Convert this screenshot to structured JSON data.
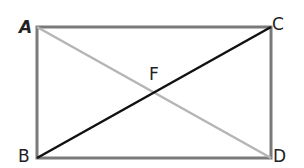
{
  "diagram": {
    "title": "",
    "points": {
      "A": {
        "label": "A",
        "x": 37,
        "y": 27
      },
      "C": {
        "label": "C",
        "x": 271,
        "y": 27
      },
      "B": {
        "label": "B",
        "x": 37,
        "y": 158
      },
      "D": {
        "label": "D",
        "x": 271,
        "y": 158
      },
      "F": {
        "label": "F",
        "x": 154,
        "y": 92
      }
    },
    "labels": {
      "A": "A",
      "B": "B",
      "C": "C",
      "D": "D",
      "F": "F"
    },
    "colors": {
      "rectangle": "#7a7a7a",
      "diagonal_AD": "#b5b5b5",
      "diagonal_BC": "#111111"
    },
    "segments": [
      {
        "from": "A",
        "to": "C",
        "role": "rectangle-side"
      },
      {
        "from": "C",
        "to": "D",
        "role": "rectangle-side"
      },
      {
        "from": "D",
        "to": "B",
        "role": "rectangle-side"
      },
      {
        "from": "B",
        "to": "A",
        "role": "rectangle-side"
      },
      {
        "from": "A",
        "to": "D",
        "role": "diagonal"
      },
      {
        "from": "B",
        "to": "C",
        "role": "diagonal"
      }
    ]
  }
}
